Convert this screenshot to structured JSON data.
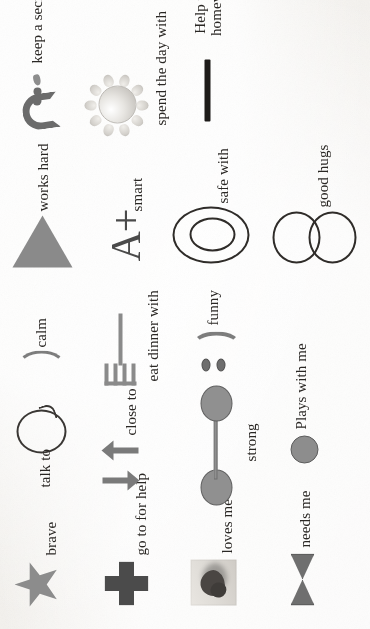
{
  "page": {
    "kind": "scanned-worksheet-photo",
    "orientation": "rotated-90-ccw",
    "background_color": "#f3f1ee",
    "ink_color": "#2a2724"
  },
  "items": [
    {
      "id": "brave",
      "icon": "star-icon",
      "label": "brave"
    },
    {
      "id": "go-to-for-help",
      "icon": "plus-cross-icon",
      "label": "go to for help"
    },
    {
      "id": "loves-me",
      "icon": "heart-photo-icon",
      "label": "loves me"
    },
    {
      "id": "needs-me",
      "icon": "bowtie-icon",
      "label": "needs me"
    },
    {
      "id": "talk-to",
      "icon": "speech-bubble-icon",
      "label": "talk to"
    },
    {
      "id": "close-to",
      "icon": "two-arrows-icon",
      "label": "close to"
    },
    {
      "id": "strong",
      "icon": "dumbbell-icon",
      "label": "strong"
    },
    {
      "id": "plays-with-me",
      "icon": "ball-icon",
      "label": "Plays with me"
    },
    {
      "id": "calm",
      "icon": "smile-curve-icon",
      "label": "calm"
    },
    {
      "id": "eat-dinner-with",
      "icon": "fork-icon",
      "label": "eat dinner with"
    },
    {
      "id": "funny",
      "icon": "smiley-face-icon",
      "label": "funny"
    },
    {
      "id": "works-hard",
      "icon": "triangle-icon",
      "label": "works hard"
    },
    {
      "id": "smart",
      "icon": "a-plus-grade-icon",
      "label": "smart",
      "glyph_text": "A+"
    },
    {
      "id": "safe-with",
      "icon": "concentric-ovals-icon",
      "label": "safe with"
    },
    {
      "id": "good-hugs",
      "icon": "two-circles-icon",
      "label": "good hugs"
    },
    {
      "id": "keep-a-secret",
      "icon": "shush-lips-icon",
      "label": "keep a secret"
    },
    {
      "id": "spend-the-day-with",
      "icon": "sun-icon",
      "label": "spend the day with"
    },
    {
      "id": "help-with-homework",
      "icon": "horizontal-rule-icon",
      "label": "Help with homework",
      "label_line1": "Help with",
      "label_line2": "homework"
    }
  ]
}
